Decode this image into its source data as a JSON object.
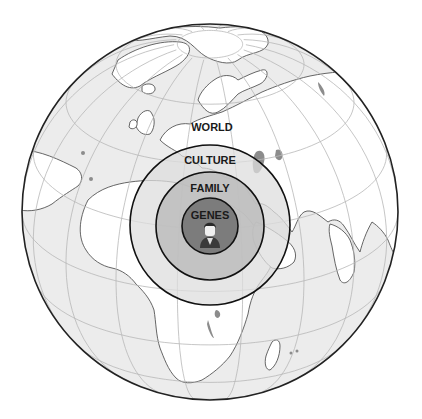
{
  "figure": {
    "colors": {
      "ocean": "#ececec",
      "land": "#ffffff",
      "coastline": "#555555",
      "graticule": "#b8b8b8",
      "globe_outline": "#222222",
      "culture_fill": "#dedede",
      "family_fill": "#bcbcbc",
      "genes_fill": "#7c7c7c",
      "ring_stroke": "#111111"
    },
    "labels": {
      "world": "WORLD",
      "culture": "CULTURE",
      "family": "FAMILY",
      "genes": "GENES"
    },
    "rings": [
      {
        "name": "culture",
        "level": 1
      },
      {
        "name": "family",
        "level": 2
      },
      {
        "name": "genes",
        "level": 3
      }
    ],
    "center_icon": "person-icon"
  }
}
